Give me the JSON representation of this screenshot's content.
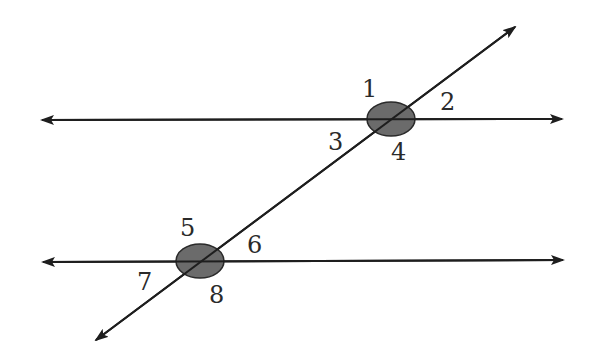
{
  "diagram": {
    "colors": {
      "line": "#1e1e1e",
      "intersection_fill": "#6b6b6b",
      "intersection_stroke": "#2a2a2a",
      "label": "#2a2a2a",
      "background": "#ffffff"
    },
    "lines": [
      {
        "id": "parallel-line-top",
        "x1": 42,
        "y1": 120,
        "x2": 562,
        "y2": 119,
        "arrows": "both"
      },
      {
        "id": "parallel-line-bottom",
        "x1": 43,
        "y1": 262,
        "x2": 563,
        "y2": 260,
        "arrows": "both"
      },
      {
        "id": "transversal",
        "x1": 96,
        "y1": 340,
        "x2": 515,
        "y2": 27,
        "arrows": "both"
      }
    ],
    "intersections": [
      {
        "id": "intersection-top",
        "cx": 391,
        "cy": 119,
        "rx": 24,
        "ry": 17
      },
      {
        "id": "intersection-bottom",
        "cx": 200,
        "cy": 261,
        "rx": 24,
        "ry": 17
      }
    ],
    "angles": [
      {
        "label": "1",
        "x": 362,
        "y": 97
      },
      {
        "label": "2",
        "x": 440,
        "y": 110
      },
      {
        "label": "3",
        "x": 328,
        "y": 150
      },
      {
        "label": "4",
        "x": 391,
        "y": 160
      },
      {
        "label": "5",
        "x": 180,
        "y": 236
      },
      {
        "label": "6",
        "x": 247,
        "y": 253
      },
      {
        "label": "7",
        "x": 137,
        "y": 290
      },
      {
        "label": "8",
        "x": 209,
        "y": 303
      }
    ]
  }
}
